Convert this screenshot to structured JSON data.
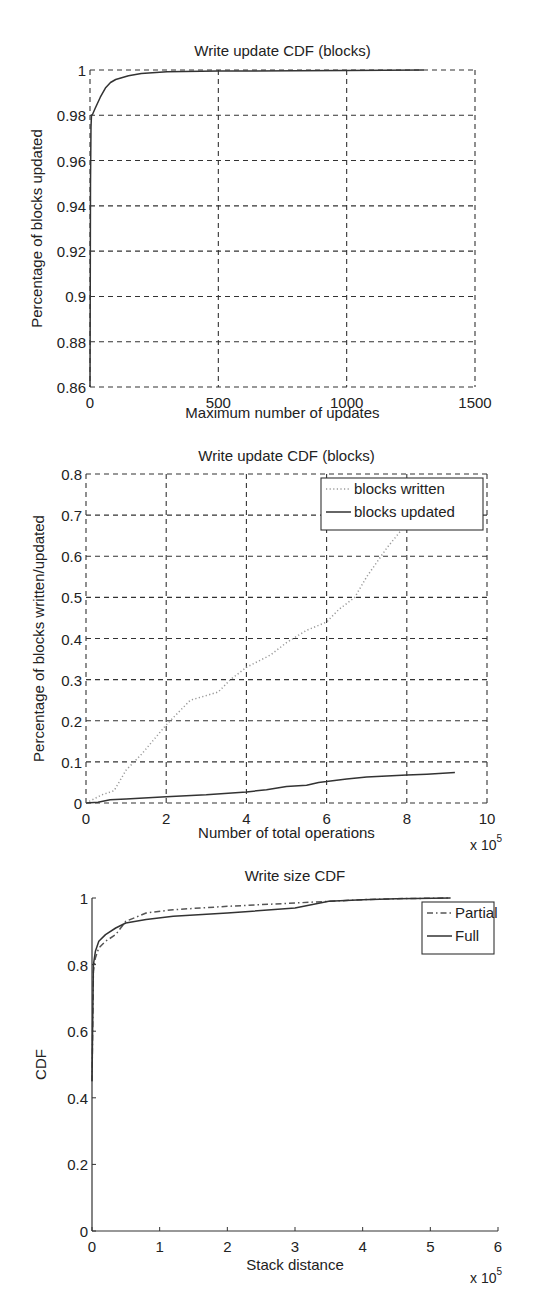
{
  "chart_data": [
    {
      "type": "line",
      "title": "Write update CDF (blocks)",
      "xlabel": "Maximum number of updates",
      "ylabel": "Percentage of blocks updated",
      "xlim": [
        0,
        1500
      ],
      "ylim": [
        0.86,
        1.0
      ],
      "xticks": [
        "0",
        "500",
        "1000",
        "1500"
      ],
      "yticks": [
        "0.86",
        "0.88",
        "0.9",
        "0.92",
        "0.94",
        "0.96",
        "0.98",
        "1"
      ],
      "grid": true,
      "legend": null,
      "series": [
        {
          "name": "blocks updated CDF",
          "x": [
            0,
            2,
            4,
            6,
            10,
            20,
            40,
            60,
            80,
            100,
            150,
            200,
            300,
            500,
            800,
            1000,
            1300
          ],
          "y": [
            0.86,
            0.95,
            0.975,
            0.98,
            0.9805,
            0.983,
            0.988,
            0.992,
            0.9945,
            0.9958,
            0.9975,
            0.9985,
            0.9992,
            0.9995,
            0.9997,
            0.9998,
            1.0
          ]
        }
      ]
    },
    {
      "type": "line",
      "title": "Write update CDF (blocks)",
      "xlabel": "Number of total operations",
      "ylabel": "Percentage of blocks written/updated",
      "x_multiplier": "x 10^5",
      "xlim": [
        0,
        10
      ],
      "ylim": [
        0,
        0.8
      ],
      "xticks": [
        "0",
        "2",
        "4",
        "6",
        "8",
        "10"
      ],
      "yticks": [
        "0",
        "0.1",
        "0.2",
        "0.3",
        "0.4",
        "0.5",
        "0.6",
        "0.7",
        "0.8"
      ],
      "grid": true,
      "legend": {
        "position": "upper right",
        "entries": [
          "blocks written",
          "blocks updated"
        ]
      },
      "series": [
        {
          "name": "blocks written",
          "style": "dotted",
          "x": [
            0,
            0.4,
            0.7,
            1.0,
            1.4,
            2.0,
            2.6,
            3.3,
            3.6,
            4.0,
            4.6,
            5.0,
            5.5,
            6.0,
            6.3,
            6.7,
            7.0,
            7.5,
            8.0
          ],
          "y": [
            0,
            0.02,
            0.03,
            0.08,
            0.12,
            0.19,
            0.25,
            0.27,
            0.3,
            0.33,
            0.36,
            0.39,
            0.42,
            0.44,
            0.47,
            0.5,
            0.55,
            0.62,
            0.68
          ]
        },
        {
          "name": "blocks updated",
          "style": "solid",
          "x": [
            0,
            0.3,
            0.6,
            1.0,
            2.0,
            3.0,
            4.0,
            4.5,
            5.0,
            5.5,
            5.8,
            6.0,
            6.5,
            7.0,
            7.5,
            8.0,
            8.5,
            9.2
          ],
          "y": [
            0,
            0.002,
            0.008,
            0.01,
            0.015,
            0.02,
            0.027,
            0.032,
            0.04,
            0.043,
            0.05,
            0.052,
            0.058,
            0.063,
            0.066,
            0.068,
            0.07,
            0.074
          ]
        }
      ]
    },
    {
      "type": "line",
      "title": "Write size CDF",
      "xlabel": "Stack distance",
      "ylabel": "CDF",
      "x_multiplier": "x 10^5",
      "xlim": [
        0,
        6
      ],
      "ylim": [
        0,
        1
      ],
      "xticks": [
        "0",
        "1",
        "2",
        "3",
        "4",
        "5",
        "6"
      ],
      "yticks": [
        "0",
        "0.2",
        "0.4",
        "0.6",
        "0.8",
        "1"
      ],
      "grid": false,
      "legend": {
        "position": "upper right",
        "entries": [
          "Partial",
          "Full"
        ]
      },
      "series": [
        {
          "name": "Partial",
          "style": "dash-dot",
          "x": [
            0,
            0.02,
            0.05,
            0.1,
            0.2,
            0.35,
            0.5,
            0.8,
            1.2,
            2.0,
            3.0,
            3.5,
            4.0,
            4.5,
            5.3
          ],
          "y": [
            0.45,
            0.78,
            0.82,
            0.85,
            0.87,
            0.89,
            0.93,
            0.955,
            0.965,
            0.975,
            0.985,
            0.99,
            0.995,
            0.998,
            1.0
          ]
        },
        {
          "name": "Full",
          "style": "solid",
          "x": [
            0,
            0.02,
            0.05,
            0.1,
            0.2,
            0.35,
            0.5,
            0.8,
            1.2,
            2.0,
            3.0,
            3.5,
            4.0,
            4.5,
            5.3
          ],
          "y": [
            0.45,
            0.8,
            0.84,
            0.87,
            0.89,
            0.91,
            0.925,
            0.935,
            0.945,
            0.955,
            0.97,
            0.99,
            0.995,
            0.998,
            1.0
          ]
        }
      ]
    }
  ]
}
